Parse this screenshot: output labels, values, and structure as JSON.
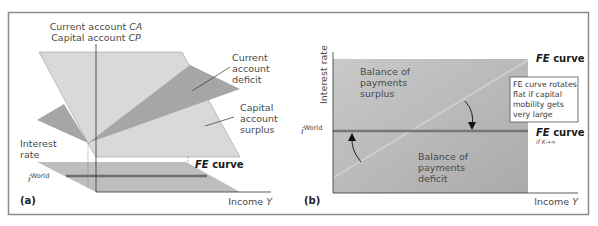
{
  "figure": {
    "panel_a": {
      "tag": "(a)",
      "axis_top_line1_prefix": "Current account ",
      "axis_top_line1_var": "CA",
      "axis_top_line2_prefix": "Capital account ",
      "axis_top_line2_var": "CP",
      "current_account_deficit": [
        "Current",
        "account",
        "deficit"
      ],
      "capital_account_surplus": [
        "Capital",
        "account",
        "surplus"
      ],
      "interest_rate": [
        "Interest",
        "rate"
      ],
      "i_world_base": "i",
      "i_world_sup": "World",
      "fe_curve_italic": "FE",
      "fe_curve_rest": " curve",
      "x_axis_prefix": "Income ",
      "x_axis_var": "Y"
    },
    "panel_b": {
      "tag": "(b)",
      "y_axis": "Interest rate",
      "bop_surplus": [
        "Balance of",
        "payments",
        "surplus"
      ],
      "bop_deficit": [
        "Balance of",
        "payments",
        "deficit"
      ],
      "i_world_base": "i",
      "i_world_sup": "World",
      "fe_curve_italic": "FE",
      "fe_curve_rest": " curve",
      "fe_flat_italic": "FE",
      "fe_flat_rest": " curve",
      "fe_flat_condition": "if K→∞",
      "callout": [
        "FE curve rotates",
        "flat if capital",
        "mobility gets",
        "very large"
      ],
      "x_axis_prefix": "Income ",
      "x_axis_var": "Y"
    },
    "colors": {
      "border": "#8a8a8a",
      "light_plane": "#d9d9d9",
      "dark_plane": "#a6a6a6",
      "floor_plane": "#b3b3b3",
      "world_line": "#6e6e6e",
      "panel_b_fill": "#bdbdbd"
    }
  }
}
